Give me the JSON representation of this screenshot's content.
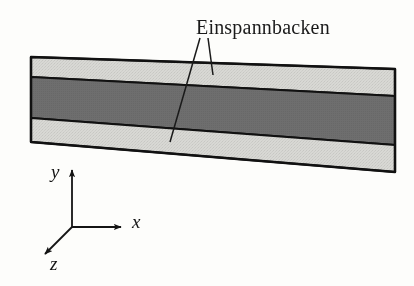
{
  "figure": {
    "title_visible": false,
    "background_color": "#fdfdfb",
    "width": 414,
    "height": 286
  },
  "annotation": {
    "label": "Einspannbacken",
    "label_x": 196,
    "label_y": 16,
    "color": "#1a1a1a",
    "leader_lines": [
      {
        "name": "leader-to-upper-jaw",
        "x1": 208,
        "y1": 38,
        "x2": 213,
        "y2": 75
      },
      {
        "name": "leader-to-lower-jaw",
        "x1": 200,
        "y1": 38,
        "x2": 170,
        "y2": 142
      }
    ]
  },
  "specimen": {
    "name": "layered-specimen-slab",
    "description": "Three-layer rectangular slab drawn in oblique perspective, tilted down to the right",
    "outline_color": "#111111",
    "outline_width": 2.2,
    "corners": {
      "top_left_x": 31,
      "top_left_y": 57,
      "top_right_x": 395,
      "top_right_y": 69,
      "bottom_right_x": 395,
      "bottom_right_y": 172,
      "bottom_left_x": 31,
      "bottom_left_y": 142
    },
    "bands": [
      {
        "name": "upper-clamping-jaw-band",
        "role": "Einspannbacken",
        "fill": "#d8d8d4",
        "left_top_y": 57,
        "left_bottom_y": 77,
        "right_top_y": 69,
        "right_bottom_y": 96
      },
      {
        "name": "specimen-core-band",
        "role": "Probe",
        "fill": "#6e6e6e",
        "left_top_y": 77,
        "left_bottom_y": 118,
        "right_top_y": 96,
        "right_bottom_y": 145
      },
      {
        "name": "lower-clamping-jaw-band",
        "role": "Einspannbacken",
        "fill": "#d8d8d4",
        "left_top_y": 118,
        "left_bottom_y": 142,
        "right_top_y": 145,
        "right_bottom_y": 172
      }
    ]
  },
  "axes": {
    "name": "coordinate-triad",
    "origin_x": 72,
    "origin_y": 227,
    "line_color": "#141414",
    "line_width": 1.8,
    "items": [
      {
        "name": "y-axis",
        "label": "y",
        "tip_x": 72,
        "tip_y": 166,
        "label_x": 51,
        "label_y": 161
      },
      {
        "name": "x-axis",
        "label": "x",
        "tip_x": 126,
        "tip_y": 227,
        "label_x": 132,
        "label_y": 211
      },
      {
        "name": "z-axis",
        "label": "z",
        "tip_x": 41,
        "tip_y": 258,
        "label_x": 50,
        "label_y": 253
      }
    ]
  }
}
